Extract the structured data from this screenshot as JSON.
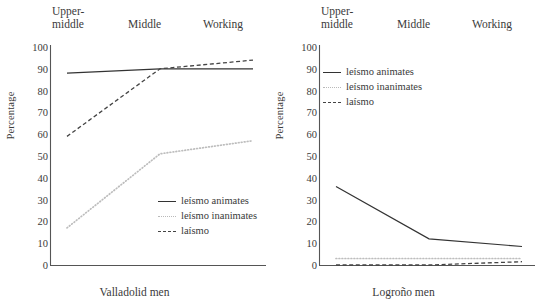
{
  "figure": {
    "panels": [
      {
        "id": "valladolid",
        "x_axis_title": "Valladolid men",
        "y_axis_title": "Percentage",
        "category_labels": [
          "Upper-\nmiddle",
          "Middle",
          "Working"
        ],
        "y_ticks": [
          "100",
          "90",
          "80",
          "70",
          "60",
          "50",
          "40",
          "30",
          "20",
          "10",
          "0"
        ],
        "legend": [
          {
            "label": "leísmo animates",
            "style": "solid",
            "color": "#333333"
          },
          {
            "label": "leísmo inanimates",
            "style": "dotted",
            "color": "#bdbdbd"
          },
          {
            "label": "laísmo",
            "style": "dashed",
            "color": "#444444"
          }
        ]
      },
      {
        "id": "logrono",
        "x_axis_title": "Logroño men",
        "y_axis_title": "Percentage",
        "category_labels": [
          "Upper-\nmiddle",
          "Middle",
          "Working"
        ],
        "y_ticks": [
          "100",
          "90",
          "80",
          "70",
          "60",
          "50",
          "40",
          "30",
          "20",
          "10",
          "0"
        ],
        "legend": [
          {
            "label": "leísmo animates",
            "style": "solid",
            "color": "#333333"
          },
          {
            "label": "leísmo inanimates",
            "style": "dotted",
            "color": "#bdbdbd"
          },
          {
            "label": "laísmo",
            "style": "dashed",
            "color": "#444444"
          }
        ]
      }
    ]
  },
  "chart_data": [
    {
      "type": "line",
      "title": "Valladolid men",
      "xlabel": "Valladolid men",
      "ylabel": "Percentage",
      "categories": [
        "Upper-middle",
        "Middle",
        "Working"
      ],
      "ylim": [
        0,
        100
      ],
      "ytick_step": 10,
      "grid": false,
      "legend_position": "inside-bottom-right",
      "series": [
        {
          "name": "leísmo animates",
          "style": "solid",
          "color": "#333333",
          "values": [
            88,
            90,
            90
          ]
        },
        {
          "name": "leísmo inanimates",
          "style": "dotted",
          "color": "#bdbdbd",
          "values": [
            17,
            51,
            57
          ]
        },
        {
          "name": "laísmo",
          "style": "dashed",
          "color": "#444444",
          "values": [
            59,
            90,
            94
          ]
        }
      ]
    },
    {
      "type": "line",
      "title": "Logroño men",
      "xlabel": "Logroño men",
      "ylabel": "Percentage",
      "categories": [
        "Upper-middle",
        "Middle",
        "Working"
      ],
      "ylim": [
        0,
        100
      ],
      "ytick_step": 10,
      "grid": false,
      "legend_position": "inside-top-left",
      "series": [
        {
          "name": "leísmo animates",
          "style": "solid",
          "color": "#333333",
          "values": [
            36,
            12,
            8.5
          ]
        },
        {
          "name": "leísmo inanimates",
          "style": "dotted",
          "color": "#bdbdbd",
          "values": [
            3,
            3,
            3
          ]
        },
        {
          "name": "laísmo",
          "style": "dashed",
          "color": "#444444",
          "values": [
            0,
            0,
            1.5
          ]
        }
      ]
    }
  ]
}
